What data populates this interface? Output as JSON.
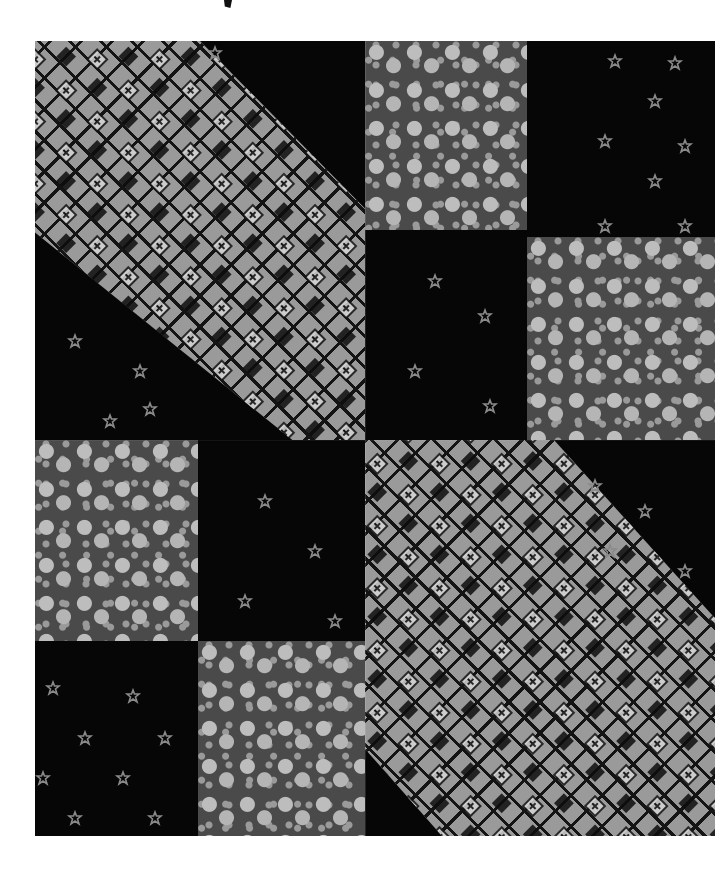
{
  "image": {
    "subject": "quilt block photograph",
    "palette": {
      "background": "#ffffff",
      "dark_fabric": "#060606",
      "floral_ground": "#4a4a4a",
      "floral_motif": "#bdbdbd",
      "checker_light": "#c8c8c8",
      "checker_mid": "#9a9a9a",
      "checker_dark": "#141414"
    },
    "blocks": [
      {
        "name": "top-left-checker-band",
        "fabric": "checkered diamond with cross motif"
      },
      {
        "name": "top-right-floral-1",
        "fabric": "gray floral"
      },
      {
        "name": "top-right-dark-1",
        "fabric": "black with small stars"
      },
      {
        "name": "top-right-dark-2",
        "fabric": "black with small stars"
      },
      {
        "name": "top-right-floral-2",
        "fabric": "gray floral"
      },
      {
        "name": "bottom-left-floral-1",
        "fabric": "gray floral"
      },
      {
        "name": "bottom-left-dark-1",
        "fabric": "black with small stars"
      },
      {
        "name": "bottom-left-dark-2",
        "fabric": "black with small stars"
      },
      {
        "name": "bottom-left-floral-2",
        "fabric": "gray floral"
      },
      {
        "name": "bottom-right-checker-band",
        "fabric": "checkered diamond with cross motif"
      }
    ]
  }
}
